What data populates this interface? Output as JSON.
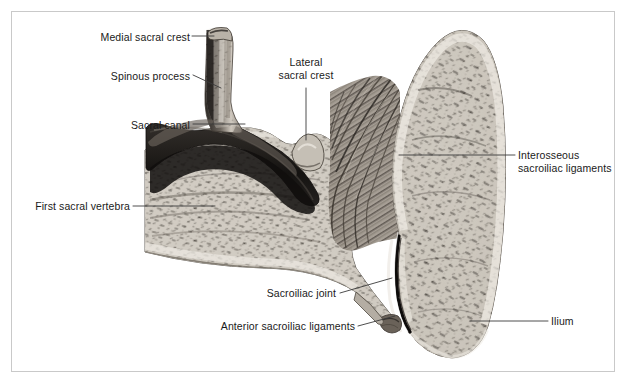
{
  "figure": {
    "background_color": "#ffffff",
    "frame_color": "#c9c9c9",
    "label_color": "#1a1a1a",
    "leader_color": "#3a3a3a",
    "bone_light": "#d8d4cd",
    "bone_mid": "#9a948c",
    "bone_dark": "#4a453f",
    "canal_color": "#1f1c1a",
    "ligament_color": "#6e6860"
  },
  "labels": [
    {
      "id": "medial-sacral-crest",
      "text": "Medial sacral crest",
      "lines": [
        "Medial sacral crest"
      ],
      "align": "right",
      "x": 85,
      "y": 31,
      "width": 105
    },
    {
      "id": "spinous-process",
      "text": "Spinous process",
      "lines": [
        "Spinous process"
      ],
      "align": "right",
      "x": 90,
      "y": 70,
      "width": 100
    },
    {
      "id": "sacral-canal",
      "text": "Sacral canal",
      "lines": [
        "Sacral canal"
      ],
      "align": "right",
      "x": 110,
      "y": 119,
      "width": 80
    },
    {
      "id": "first-sacral-vertebra",
      "text": "First sacral vertebra",
      "lines": [
        "First sacral vertebra"
      ],
      "align": "right",
      "x": 20,
      "y": 200,
      "width": 110
    },
    {
      "id": "lateral-sacral-crest",
      "text": "Lateral sacral crest",
      "lines": [
        "Lateral",
        "sacral crest"
      ],
      "align": "center",
      "x": 266,
      "y": 56,
      "width": 80
    },
    {
      "id": "interosseous-sacroiliac-ligaments",
      "text": "Interosseous sacroiliac ligaments",
      "lines": [
        "Interosseous",
        "sacroiliac ligaments"
      ],
      "align": "left",
      "x": 518,
      "y": 149,
      "width": 105
    },
    {
      "id": "ilium",
      "text": "Ilium",
      "lines": [
        "Ilium"
      ],
      "align": "left",
      "x": 551,
      "y": 315,
      "width": 40
    },
    {
      "id": "sacroiliac-joint",
      "text": "Sacroiliac joint",
      "lines": [
        "Sacroiliac joint"
      ],
      "align": "right",
      "x": 246,
      "y": 287,
      "width": 90
    },
    {
      "id": "anterior-sacroiliac-ligaments",
      "text": "Anterior sacroiliac ligaments",
      "lines": [
        "Anterior sacroiliac ligaments"
      ],
      "align": "right",
      "x": 205,
      "y": 320,
      "width": 150
    }
  ],
  "leaders": [
    {
      "id": "leader-medial-sacral-crest",
      "points": "192,36 214,36"
    },
    {
      "id": "leader-spinous-process",
      "points": "193,75 221,88"
    },
    {
      "id": "leader-sacral-canal",
      "points": "193,124 245,124"
    },
    {
      "id": "leader-first-sacral-vertebra",
      "points": "133,206 215,206"
    },
    {
      "id": "leader-lateral-sacral-crest",
      "points": "306,88 306,140"
    },
    {
      "id": "leader-interosseous-ligaments",
      "points": "515,155 399,155"
    },
    {
      "id": "leader-ilium",
      "points": "548,321 470,321"
    },
    {
      "id": "leader-sacroiliac-joint",
      "points": "340,293 392,278"
    },
    {
      "id": "leader-anterior-ligaments",
      "points": "358,326 395,316"
    }
  ],
  "structures": [
    {
      "id": "spinous-process-body",
      "name": "Spinous process"
    },
    {
      "id": "medial-sacral-crest-tip",
      "name": "Medial sacral crest"
    },
    {
      "id": "sacral-canal-cavity",
      "name": "Sacral canal"
    },
    {
      "id": "first-sacral-vertebra-body",
      "name": "First sacral vertebra"
    },
    {
      "id": "lateral-sacral-crest-ridge",
      "name": "Lateral sacral crest"
    },
    {
      "id": "interosseous-ligament-fibers",
      "name": "Interosseous sacroiliac ligaments"
    },
    {
      "id": "sacroiliac-joint-cleft",
      "name": "Sacroiliac joint"
    },
    {
      "id": "ilium-body",
      "name": "Ilium"
    },
    {
      "id": "anterior-ligament-band",
      "name": "Anterior sacroiliac ligaments"
    }
  ]
}
